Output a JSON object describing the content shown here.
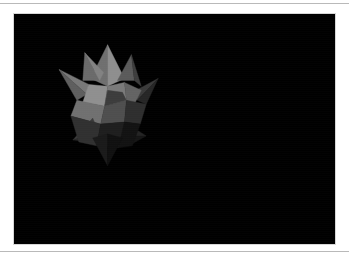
{
  "page": {
    "background_color": "#ffffff",
    "width": 349,
    "height": 257,
    "rule_color": "#b9b9b9"
  },
  "viewport": {
    "label": "3D render viewport",
    "background_color": "#000000",
    "border_color": "#d7d7d7",
    "x": 13,
    "y": 13,
    "width": 323,
    "height": 232
  },
  "figure": {
    "name": "small-stellated-dodecahedron",
    "shading": "flat-grayscale",
    "center_x": 107,
    "center_y": 105,
    "bounds": {
      "left": 58,
      "top": 44,
      "right": 158,
      "bottom": 166
    },
    "palette": {
      "highlight": "#9a9a9a",
      "light": "#8a8a8a",
      "mid_light": "#757575",
      "mid": "#606060",
      "mid_dark": "#4a4a4a",
      "dark": "#343434",
      "darker": "#232323",
      "darkest": "#141414",
      "shadow": "#0b0b0b"
    },
    "facets": [
      {
        "name": "top-spike-left",
        "fill": "#6f6f6f",
        "points": "107,44 90,78 107,86"
      },
      {
        "name": "top-spike-right",
        "fill": "#8e8e8e",
        "points": "107,44 124,78 107,86"
      },
      {
        "name": "upper-left-spike-a",
        "fill": "#6a6a6a",
        "points": "84,52 82,80 99,80"
      },
      {
        "name": "upper-left-spike-b",
        "fill": "#828282",
        "points": "84,52 99,80 103,72"
      },
      {
        "name": "upper-right-spike-a",
        "fill": "#5a5a5a",
        "points": "131,54 117,80 134,80"
      },
      {
        "name": "upper-right-spike-b",
        "fill": "#3d3d3d",
        "points": "131,54 134,80 141,86"
      },
      {
        "name": "left-spike-upper",
        "fill": "#787878",
        "points": "58,69 88,84 86,94"
      },
      {
        "name": "left-spike-lower",
        "fill": "#5e5e5e",
        "points": "58,69 86,94 76,100"
      },
      {
        "name": "right-spike-upper",
        "fill": "#3a3a3a",
        "points": "158,78 132,92 137,100"
      },
      {
        "name": "right-spike-lower",
        "fill": "#262626",
        "points": "158,78 137,100 146,104"
      },
      {
        "name": "face-upper-left",
        "fill": "#8f8f8f",
        "points": "88,84 107,86 104,106 82,102"
      },
      {
        "name": "face-upper-mid",
        "fill": "#7a7a7a",
        "points": "107,86 124,82 126,100 104,106"
      },
      {
        "name": "face-center-dark",
        "fill": "#3c3c3c",
        "points": "104,106 126,100 122,92 107,90"
      },
      {
        "name": "face-right-upper",
        "fill": "#636363",
        "points": "124,82 141,90 134,104 126,100"
      },
      {
        "name": "face-left-mid",
        "fill": "#707070",
        "points": "76,100 104,106 100,124 70,116"
      },
      {
        "name": "face-center-low",
        "fill": "#4e4e4e",
        "points": "104,106 126,100 124,122 100,124"
      },
      {
        "name": "face-right-mid",
        "fill": "#2e2e2e",
        "points": "126,100 146,104 140,124 124,122"
      },
      {
        "name": "lower-left-spike-a",
        "fill": "#3a3a3a",
        "points": "72,140 92,118 98,132"
      },
      {
        "name": "lower-left-spike-b",
        "fill": "#282828",
        "points": "72,140 98,132 90,142"
      },
      {
        "name": "lower-right-spike-a",
        "fill": "#242424",
        "points": "146,136 124,122 120,136"
      },
      {
        "name": "lower-right-spike-b",
        "fill": "#161616",
        "points": "146,136 120,136 128,146"
      },
      {
        "name": "face-lower-left",
        "fill": "#303030",
        "points": "70,116 100,124 96,146 78,142"
      },
      {
        "name": "face-lower-mid",
        "fill": "#1e1e1e",
        "points": "100,124 124,122 118,148 96,146"
      },
      {
        "name": "face-lower-right",
        "fill": "#121212",
        "points": "124,122 140,124 132,146 118,148"
      },
      {
        "name": "bottom-spike-left",
        "fill": "#1a1a1a",
        "points": "107,166 92,138 107,134"
      },
      {
        "name": "bottom-spike-right",
        "fill": "#101010",
        "points": "107,166 122,138 107,134"
      }
    ]
  }
}
